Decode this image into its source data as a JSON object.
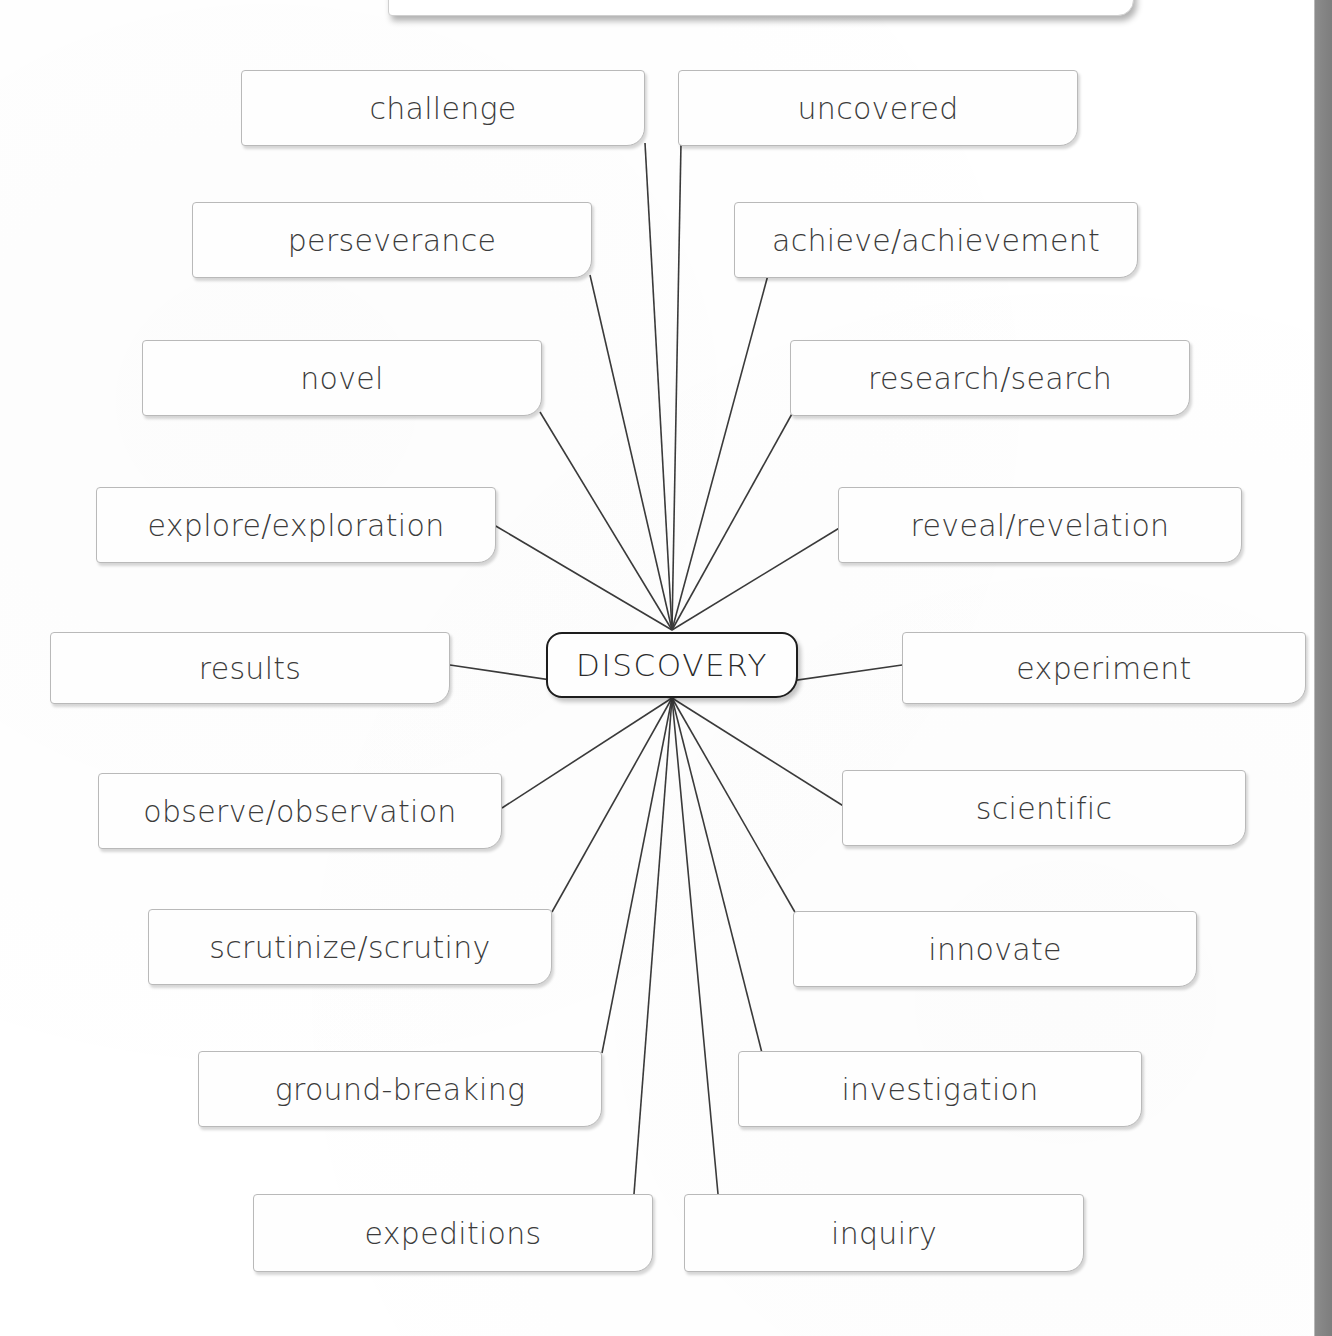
{
  "diagram": {
    "type": "mind-map",
    "center": {
      "label": "DISCOVERY",
      "x": 546,
      "y": 632,
      "w": 252,
      "h": 66
    },
    "hub_top": {
      "x": 672,
      "y": 630
    },
    "hub_bottom": {
      "x": 672,
      "y": 698
    },
    "nodes": [
      {
        "id": "challenge",
        "label": "challenge",
        "side": "left",
        "x": 241,
        "y": 70,
        "w": 404,
        "h": 76,
        "anchor": "right-bottom",
        "ax": 645,
        "ay": 143
      },
      {
        "id": "uncovered",
        "label": "uncovered",
        "side": "right",
        "x": 678,
        "y": 70,
        "w": 400,
        "h": 76,
        "anchor": "left-bottom",
        "ax": 681,
        "ay": 143
      },
      {
        "id": "perseverance",
        "label": "perseverance",
        "side": "left",
        "x": 192,
        "y": 202,
        "w": 400,
        "h": 76,
        "anchor": "right-bottom",
        "ax": 590,
        "ay": 275
      },
      {
        "id": "achieve",
        "label": "achieve/achievement",
        "side": "right",
        "x": 734,
        "y": 202,
        "w": 404,
        "h": 76,
        "anchor": "left-bottom",
        "ax": 768,
        "ay": 275
      },
      {
        "id": "novel",
        "label": "novel",
        "side": "left",
        "x": 142,
        "y": 340,
        "w": 400,
        "h": 76,
        "anchor": "right-bottom",
        "ax": 540,
        "ay": 412
      },
      {
        "id": "research",
        "label": "research/search",
        "side": "right",
        "x": 790,
        "y": 340,
        "w": 400,
        "h": 76,
        "anchor": "left-bottom",
        "ax": 793,
        "ay": 412
      },
      {
        "id": "explore",
        "label": "explore/exploration",
        "side": "left",
        "x": 96,
        "y": 487,
        "w": 400,
        "h": 76,
        "anchor": "right-bottom",
        "ax": 494,
        "ay": 525
      },
      {
        "id": "reveal",
        "label": "reveal/revelation",
        "side": "right",
        "x": 838,
        "y": 487,
        "w": 404,
        "h": 76,
        "anchor": "left-bottom",
        "ax": 841,
        "ay": 527
      },
      {
        "id": "results",
        "label": "results",
        "side": "left",
        "x": 50,
        "y": 632,
        "w": 400,
        "h": 72,
        "anchor": "right-mid",
        "ax": 450,
        "ay": 665
      },
      {
        "id": "experiment",
        "label": "experiment",
        "side": "right",
        "x": 902,
        "y": 632,
        "w": 404,
        "h": 72,
        "anchor": "left-mid",
        "ax": 902,
        "ay": 665
      },
      {
        "id": "observe",
        "label": "observe/observation",
        "side": "left",
        "x": 98,
        "y": 773,
        "w": 404,
        "h": 76,
        "anchor": "right-top",
        "ax": 502,
        "ay": 808
      },
      {
        "id": "scientific",
        "label": "scientific",
        "side": "right",
        "x": 842,
        "y": 770,
        "w": 404,
        "h": 76,
        "anchor": "left-top",
        "ax": 845,
        "ay": 807
      },
      {
        "id": "scrutinize",
        "label": "scrutinize/scrutiny",
        "side": "left",
        "x": 148,
        "y": 909,
        "w": 404,
        "h": 76,
        "anchor": "right-top",
        "ax": 552,
        "ay": 912
      },
      {
        "id": "innovate",
        "label": "innovate",
        "side": "right",
        "x": 793,
        "y": 911,
        "w": 404,
        "h": 76,
        "anchor": "left-top",
        "ax": 796,
        "ay": 914
      },
      {
        "id": "groundbreak",
        "label": "ground-breaking",
        "side": "left",
        "x": 198,
        "y": 1051,
        "w": 404,
        "h": 76,
        "anchor": "right-top",
        "ax": 602,
        "ay": 1053
      },
      {
        "id": "investigate",
        "label": "investigation",
        "side": "right",
        "x": 738,
        "y": 1051,
        "w": 404,
        "h": 76,
        "anchor": "left-top",
        "ax": 762,
        "ay": 1053
      },
      {
        "id": "expeditions",
        "label": "expeditions",
        "side": "left",
        "x": 253,
        "y": 1194,
        "w": 400,
        "h": 78,
        "anchor": "top",
        "ax": 634,
        "ay": 1194
      },
      {
        "id": "inquiry",
        "label": "inquiry",
        "side": "right",
        "x": 684,
        "y": 1194,
        "w": 400,
        "h": 78,
        "anchor": "top",
        "ax": 718,
        "ay": 1194
      }
    ]
  },
  "edge_strip": {
    "label": ""
  },
  "colors": {
    "page_background": "#ffffff",
    "node_fill": "#fefefe",
    "node_border": "#b9b9b9",
    "center_border": "#1d1d1d",
    "connector": "#3a3a3a",
    "text": "#3b3b3b",
    "edge_strip": "#7d7d7d"
  }
}
